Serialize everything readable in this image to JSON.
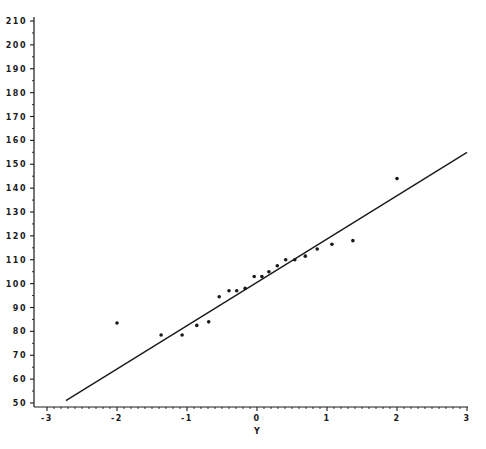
{
  "chart_data": {
    "type": "scatter",
    "title": "",
    "xlabel": "Y",
    "ylabel": "",
    "xlim": [
      -3,
      3
    ],
    "ylim": [
      50,
      210
    ],
    "x_ticks": [
      -3,
      -2,
      -1,
      0,
      1,
      2,
      3
    ],
    "y_ticks": [
      50,
      60,
      70,
      80,
      90,
      100,
      110,
      120,
      130,
      140,
      150,
      160,
      170,
      180,
      190,
      200,
      210
    ],
    "x_tick_labels": [
      "-3",
      "-2",
      "-1",
      "0",
      "1",
      "2",
      "3"
    ],
    "y_tick_labels": [
      "50",
      "60",
      "70",
      "80",
      "90",
      "100",
      "110",
      "120",
      "130",
      "140",
      "150",
      "160",
      "170",
      "180",
      "190",
      "200",
      "210"
    ],
    "x_minor_ticks_per_major": 10,
    "y_minor_ticks_per_major": 2,
    "grid": false,
    "legend": null,
    "series": [
      {
        "name": "observations",
        "kind": "scatter",
        "points": [
          {
            "x": -2.0,
            "y": 83.5
          },
          {
            "x": -1.37,
            "y": 78.5
          },
          {
            "x": -1.07,
            "y": 78.5
          },
          {
            "x": -0.86,
            "y": 82.5
          },
          {
            "x": -0.69,
            "y": 84
          },
          {
            "x": -0.54,
            "y": 94.5
          },
          {
            "x": -0.4,
            "y": 97
          },
          {
            "x": -0.29,
            "y": 97
          },
          {
            "x": -0.17,
            "y": 98
          },
          {
            "x": -0.04,
            "y": 103
          },
          {
            "x": 0.07,
            "y": 103
          },
          {
            "x": 0.17,
            "y": 105
          },
          {
            "x": 0.29,
            "y": 107.5
          },
          {
            "x": 0.41,
            "y": 110
          },
          {
            "x": 0.54,
            "y": 110
          },
          {
            "x": 0.69,
            "y": 111.5
          },
          {
            "x": 0.86,
            "y": 114.5
          },
          {
            "x": 1.07,
            "y": 116.5
          },
          {
            "x": 1.37,
            "y": 118
          },
          {
            "x": 2.0,
            "y": 144
          }
        ]
      },
      {
        "name": "reference line",
        "kind": "line",
        "points": [
          {
            "x": -2.73,
            "y": 51
          },
          {
            "x": 3.0,
            "y": 155
          }
        ]
      }
    ]
  },
  "colors": {
    "ink": "#1a1a1a",
    "background": "#ffffff"
  }
}
